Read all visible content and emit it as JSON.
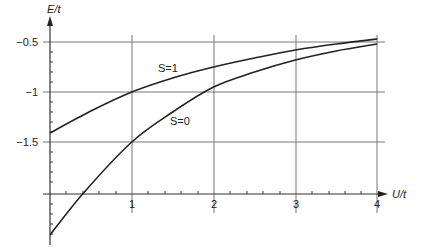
{
  "chart_data": {
    "type": "line",
    "title": "",
    "xlabel": "U/t",
    "ylabel": "E/t",
    "xlim": [
      0,
      4
    ],
    "ylim": [
      -2.45,
      -0.42
    ],
    "x_ticks": [
      1,
      2,
      3,
      4
    ],
    "x_tick_labels": [
      "1",
      "2",
      "3",
      "4"
    ],
    "y_ticks": [
      -0.5,
      -1,
      -1.5
    ],
    "y_tick_labels": [
      "−0.5",
      "−1",
      "−1.5"
    ],
    "grid": true,
    "legend": "inline labels",
    "series": [
      {
        "name": "S=1",
        "label": "S=1",
        "x": [
          0,
          0.5,
          1,
          1.5,
          2,
          2.5,
          3,
          3.5,
          4
        ],
        "y": [
          -1.41,
          -1.19,
          -1.0,
          -0.86,
          -0.75,
          -0.66,
          -0.58,
          -0.52,
          -0.47
        ]
      },
      {
        "name": "S=0",
        "label": "S=0",
        "x": [
          0,
          0.42,
          1,
          1.5,
          2,
          2.5,
          3,
          3.5,
          4
        ],
        "y": [
          -2.43,
          -2.0,
          -1.5,
          -1.2,
          -0.95,
          -0.8,
          -0.68,
          -0.59,
          -0.52
        ]
      }
    ],
    "axis_labels": {
      "x": "U/t",
      "y": "E/t"
    }
  }
}
